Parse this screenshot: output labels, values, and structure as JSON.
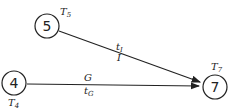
{
  "diagram": {
    "nodes": [
      {
        "id": "5",
        "label": "5",
        "time_label": "T",
        "time_sub": "5"
      },
      {
        "id": "7",
        "label": "7",
        "time_label": "T",
        "time_sub": "7"
      },
      {
        "id": "4",
        "label": "4",
        "time_label": "T",
        "time_sub": "4"
      }
    ],
    "edges": [
      {
        "from": "5",
        "to": "7",
        "label_top": "t",
        "label_top_sub": "I",
        "label_bottom": "I"
      },
      {
        "from": "4",
        "to": "7",
        "label_top": "G",
        "label_bottom": "t",
        "label_bottom_sub": "G"
      }
    ]
  },
  "colors": {
    "stroke": "#222222",
    "background": "#ffffff"
  }
}
